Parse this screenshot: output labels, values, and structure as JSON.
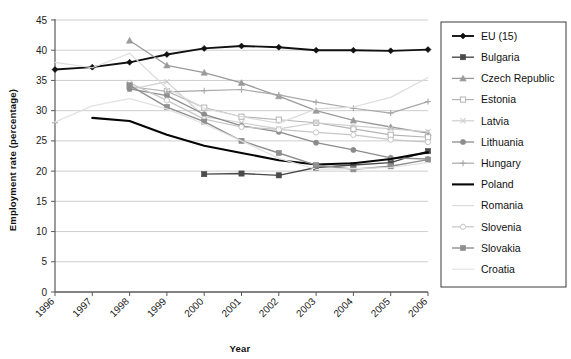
{
  "chart_data": {
    "type": "line",
    "title": "",
    "xlabel": "Year",
    "ylabel": "Employment rate (percentage)",
    "categories": [
      "1996",
      "1997",
      "1998",
      "1999",
      "2000",
      "2001",
      "2002",
      "2003",
      "2004",
      "2005",
      "2006"
    ],
    "x": [
      1996,
      1997,
      1998,
      1999,
      2000,
      2001,
      2002,
      2003,
      2004,
      2005,
      2006
    ],
    "ylim": [
      0,
      45
    ],
    "yticks": [
      0,
      5,
      10,
      15,
      20,
      25,
      30,
      35,
      40,
      45
    ],
    "grid": "horizontal",
    "legend_position": "right-outside",
    "series": [
      {
        "name": "EU (15)",
        "color": "#111111",
        "marker": "diamond",
        "width": 1.9,
        "values": [
          36.8,
          37.2,
          38.0,
          39.3,
          40.3,
          40.7,
          40.5,
          40.0,
          40.0,
          39.9,
          40.1
        ]
      },
      {
        "name": "Bulgaria",
        "color": "#4a4a4a",
        "marker": "square",
        "width": 1.4,
        "values": [
          null,
          null,
          null,
          null,
          19.5,
          19.6,
          19.3,
          20.6,
          21.0,
          21.4,
          23.3
        ]
      },
      {
        "name": "Czech Republic",
        "color": "#9a9a9a",
        "marker": "triangle",
        "width": 1.3,
        "values": [
          null,
          null,
          41.6,
          37.5,
          36.3,
          34.6,
          32.4,
          30.0,
          28.4,
          27.3,
          26.3
        ]
      },
      {
        "name": "Estonia",
        "color": "#b4b4b4",
        "marker": "square-open",
        "width": 1.2,
        "values": [
          null,
          null,
          34.0,
          33.2,
          30.5,
          29.0,
          28.5,
          28.0,
          27.0,
          26.0,
          25.6
        ]
      },
      {
        "name": "Latvia",
        "color": "#cfcfcf",
        "marker": "cross",
        "width": 1.2,
        "values": [
          null,
          null,
          33.5,
          34.8,
          29.0,
          28.0,
          27.0,
          28.0,
          27.5,
          27.0,
          26.5
        ]
      },
      {
        "name": "Lithuania",
        "color": "#8c8c8c",
        "marker": "circle",
        "width": 1.3,
        "values": [
          null,
          null,
          33.6,
          32.5,
          29.4,
          27.5,
          26.5,
          24.7,
          23.5,
          22.2,
          22.0
        ]
      },
      {
        "name": "Hungary",
        "color": "#a8a8a8",
        "marker": "plus",
        "width": 1.2,
        "values": [
          28.0,
          null,
          null,
          33.1,
          33.3,
          33.5,
          32.6,
          31.4,
          30.4,
          29.6,
          31.5
        ]
      },
      {
        "name": "Poland",
        "color": "#050505",
        "marker": "none",
        "width": 2.1,
        "values": [
          null,
          28.8,
          28.3,
          26.0,
          24.2,
          23.0,
          21.8,
          21.1,
          21.3,
          22.0,
          23.1
        ]
      },
      {
        "name": "Romania",
        "color": "#dcdcdc",
        "marker": "none",
        "width": 1.2,
        "values": [
          38.0,
          37.1,
          39.5,
          33.7,
          30.4,
          29.0,
          27.9,
          30.3,
          30.6,
          32.2,
          35.5
        ]
      },
      {
        "name": "Slovenia",
        "color": "#c6c6c6",
        "marker": "circle-open",
        "width": 1.2,
        "values": [
          null,
          null,
          34.6,
          31.7,
          28.6,
          27.3,
          26.9,
          26.4,
          26.0,
          25.2,
          24.8
        ]
      },
      {
        "name": "Slovakia",
        "color": "#8f8f8f",
        "marker": "square-filled",
        "width": 1.4,
        "values": [
          null,
          null,
          34.2,
          30.6,
          28.2,
          25.0,
          23.0,
          21.0,
          20.3,
          20.8,
          21.9
        ]
      },
      {
        "name": "Croatia",
        "color": "#e2e2e2",
        "marker": "none",
        "width": 1.2,
        "values": [
          28.1,
          30.8,
          32.0,
          30.3,
          27.8,
          25.0,
          22.1,
          20.3,
          20.4,
          20.6,
          21.4
        ]
      }
    ]
  },
  "legend": {
    "items": [
      {
        "label": "EU (15)"
      },
      {
        "label": "Bulgaria"
      },
      {
        "label": "Czech Republic"
      },
      {
        "label": "Estonia"
      },
      {
        "label": "Latvia"
      },
      {
        "label": "Lithuania"
      },
      {
        "label": "Hungary"
      },
      {
        "label": "Poland"
      },
      {
        "label": "Romania"
      },
      {
        "label": "Slovenia"
      },
      {
        "label": "Slovakia"
      },
      {
        "label": "Croatia"
      }
    ]
  },
  "axes": {
    "y_title": "Employment rate (percentage)",
    "x_title": "Year",
    "y_ticks": [
      "45",
      "40",
      "35",
      "30",
      "25",
      "20",
      "15",
      "10",
      "5",
      "0"
    ],
    "x_ticks": [
      "1996",
      "1997",
      "1998",
      "1999",
      "2000",
      "2001",
      "2002",
      "2003",
      "2004",
      "2005",
      "2006"
    ]
  },
  "colors": {
    "plot_background": "#ffffff",
    "grid": "#c8c8c8",
    "axis": "#5a5a5a",
    "legend_border": "#3a3a3a",
    "text": "#111111"
  }
}
